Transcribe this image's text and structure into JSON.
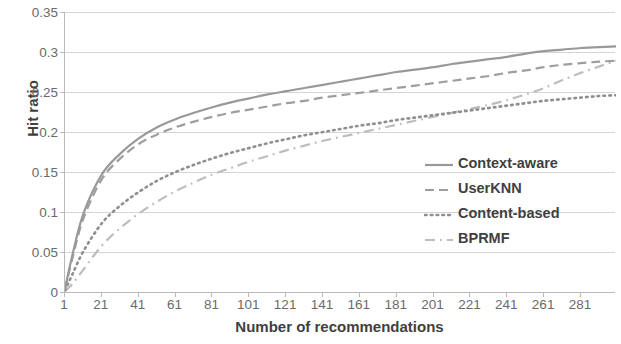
{
  "chart_data": {
    "type": "line",
    "title": "",
    "xlabel": "Number of recommendations",
    "ylabel": "Hit ratio",
    "xlim": [
      1,
      300
    ],
    "ylim": [
      0,
      0.35
    ],
    "grid": true,
    "legend_position": "inside-right",
    "x_ticks": [
      1,
      21,
      41,
      61,
      81,
      101,
      121,
      141,
      161,
      181,
      201,
      221,
      241,
      261,
      281
    ],
    "y_ticks": [
      0,
      0.05,
      0.1,
      0.15,
      0.2,
      0.25,
      0.3,
      0.35
    ],
    "y_tick_labels": [
      "0",
      "0.05",
      "0.1",
      "0.15",
      "0.2",
      "0.25",
      "0.3",
      "0.35"
    ],
    "x": [
      1,
      5,
      11,
      21,
      31,
      41,
      51,
      61,
      71,
      81,
      91,
      101,
      111,
      121,
      131,
      141,
      151,
      161,
      171,
      181,
      191,
      201,
      211,
      221,
      231,
      241,
      251,
      261,
      271,
      281,
      291,
      300
    ],
    "series": [
      {
        "name": "Context-aware",
        "style": "solid",
        "color": "#999999",
        "values": [
          0.004,
          0.046,
          0.098,
          0.147,
          0.173,
          0.192,
          0.206,
          0.216,
          0.224,
          0.231,
          0.237,
          0.242,
          0.247,
          0.251,
          0.255,
          0.259,
          0.263,
          0.267,
          0.271,
          0.275,
          0.278,
          0.281,
          0.285,
          0.288,
          0.291,
          0.294,
          0.298,
          0.301,
          0.303,
          0.305,
          0.306,
          0.307
        ]
      },
      {
        "name": "UserKNN",
        "style": "dashed",
        "color": "#9e9e9e",
        "values": [
          0.003,
          0.042,
          0.092,
          0.141,
          0.167,
          0.185,
          0.197,
          0.206,
          0.213,
          0.219,
          0.224,
          0.228,
          0.232,
          0.236,
          0.239,
          0.243,
          0.246,
          0.249,
          0.252,
          0.255,
          0.258,
          0.261,
          0.264,
          0.267,
          0.27,
          0.274,
          0.277,
          0.281,
          0.284,
          0.286,
          0.288,
          0.289
        ]
      },
      {
        "name": "Content-based",
        "style": "dotted",
        "color": "#8f8f8f",
        "values": [
          0.002,
          0.022,
          0.051,
          0.086,
          0.108,
          0.125,
          0.139,
          0.15,
          0.159,
          0.167,
          0.174,
          0.18,
          0.186,
          0.191,
          0.196,
          0.2,
          0.204,
          0.208,
          0.211,
          0.215,
          0.218,
          0.221,
          0.224,
          0.227,
          0.23,
          0.233,
          0.236,
          0.239,
          0.241,
          0.243,
          0.245,
          0.246
        ]
      },
      {
        "name": "BPRMF",
        "style": "dashdot",
        "color": "#bdbdbd",
        "values": [
          0.001,
          0.01,
          0.028,
          0.058,
          0.08,
          0.098,
          0.113,
          0.126,
          0.137,
          0.147,
          0.155,
          0.163,
          0.17,
          0.177,
          0.183,
          0.189,
          0.194,
          0.199,
          0.204,
          0.209,
          0.214,
          0.219,
          0.224,
          0.229,
          0.234,
          0.24,
          0.247,
          0.255,
          0.265,
          0.274,
          0.282,
          0.289
        ]
      }
    ]
  },
  "legend": {
    "items": [
      {
        "label": "Context-aware"
      },
      {
        "label": "UserKNN"
      },
      {
        "label": "Content-based"
      },
      {
        "label": "BPRMF"
      }
    ]
  }
}
